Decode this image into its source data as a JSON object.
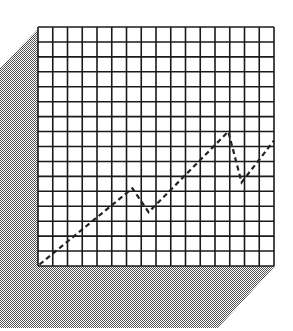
{
  "figure": {
    "grid": {
      "columns": 16,
      "rows": 16,
      "x": 38,
      "y": 27,
      "width": 236,
      "height": 239,
      "line_color": "#1a1a1a",
      "background": "#ffffff"
    },
    "shadow": {
      "points": "38,29 0,68 0,328 218,328 275,266 38,266",
      "dither_dark": "#555555",
      "dither_light": "#ffffff"
    },
    "line": {
      "style": "dashed",
      "color": "#222222",
      "points_grid_units": [
        [
          0.1,
          0.1
        ],
        [
          6.4,
          5.2
        ],
        [
          7.5,
          3.6
        ],
        [
          12.9,
          9.0
        ],
        [
          13.8,
          5.6
        ],
        [
          16,
          8.4
        ]
      ]
    }
  },
  "chart_data": {
    "type": "line",
    "title": "",
    "xlabel": "",
    "ylabel": "",
    "grid": true,
    "xlim": [
      0,
      16
    ],
    "ylim": [
      0,
      16
    ],
    "series": [
      {
        "name": "trend",
        "x": [
          0.1,
          6.4,
          7.5,
          12.9,
          13.8,
          16
        ],
        "y": [
          0.1,
          5.2,
          3.6,
          9.0,
          5.6,
          8.4
        ]
      }
    ]
  }
}
